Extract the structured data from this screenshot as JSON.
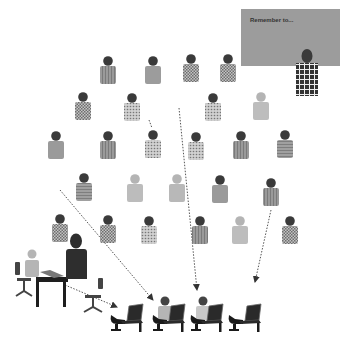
{
  "board": {
    "text": "Remember to..."
  },
  "colors": {
    "head": "#3a3a3a",
    "board": "#9a9a9a",
    "teacher": "#2e2e2e",
    "arrow": "#555555"
  },
  "audience": [
    {
      "row": 1,
      "pattern": "stripes",
      "tone": "#8c8c8c"
    },
    {
      "row": 1,
      "pattern": "solid",
      "tone": "#9c9c9c"
    },
    {
      "row": 1,
      "pattern": "checker",
      "tone": "#b0b0b0"
    },
    {
      "row": 1,
      "pattern": "checker",
      "tone": "#8a8a8a"
    },
    {
      "row": 2,
      "pattern": "checker",
      "tone": "#8e8e8e"
    },
    {
      "row": 2,
      "pattern": "dots",
      "tone": "#b8b8b8"
    },
    {
      "row": 2,
      "pattern": "dots",
      "tone": "#a0a0a0"
    },
    {
      "row": 2,
      "pattern": "solid-light",
      "tone": "#bdbdbd"
    },
    {
      "row": 3,
      "pattern": "solid",
      "tone": "#9a9a9a"
    },
    {
      "row": 3,
      "pattern": "stripes",
      "tone": "#888888"
    },
    {
      "row": 3,
      "pattern": "dots",
      "tone": "#a5a5a5"
    },
    {
      "row": 3,
      "pattern": "dots",
      "tone": "#a8a8a8"
    },
    {
      "row": 3,
      "pattern": "stripes",
      "tone": "#8a8a8a"
    },
    {
      "row": 3,
      "pattern": "lines",
      "tone": "#9a9a9a"
    },
    {
      "row": 4,
      "pattern": "lines",
      "tone": "#8f8f8f"
    },
    {
      "row": 4,
      "pattern": "solid-light",
      "tone": "#bcbcbc"
    },
    {
      "row": 4,
      "pattern": "solid-light",
      "tone": "#b8b8b8"
    },
    {
      "row": 4,
      "pattern": "solid",
      "tone": "#9a9a9a"
    },
    {
      "row": 4,
      "pattern": "stripes",
      "tone": "#8a8a8a"
    },
    {
      "row": 5,
      "pattern": "checker",
      "tone": "#8a8a8a"
    },
    {
      "row": 5,
      "pattern": "checker",
      "tone": "#a8a8a8"
    },
    {
      "row": 5,
      "pattern": "dots",
      "tone": "#b0b0b0"
    },
    {
      "row": 5,
      "pattern": "stripes",
      "tone": "#8c8c8c"
    },
    {
      "row": 5,
      "pattern": "solid-light",
      "tone": "#bdbdbd"
    },
    {
      "row": 5,
      "pattern": "checker",
      "tone": "#7e7e7e"
    }
  ],
  "arrows": [
    {
      "from": "audience-row3-col5-to-front",
      "label": ""
    },
    {
      "from": "audience-row2-to-front",
      "label": ""
    },
    {
      "from": "audience-row4-right-to-front",
      "label": ""
    },
    {
      "from": "audience-row4-left-to-front",
      "label": ""
    },
    {
      "from": "desk-to-front",
      "label": ""
    }
  ],
  "front_seats": [
    {
      "occupied": false
    },
    {
      "occupied": true,
      "tone": "#b5b5b5"
    },
    {
      "occupied": true,
      "tone": "#c8c8c8"
    },
    {
      "occupied": false
    }
  ]
}
